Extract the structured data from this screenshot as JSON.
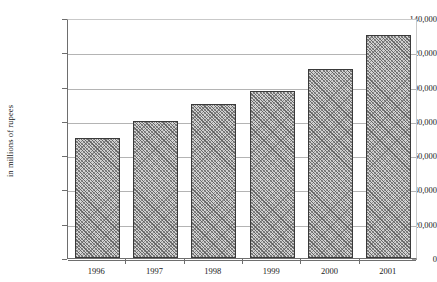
{
  "chart_data": {
    "type": "bar",
    "title": "",
    "subtitle": "",
    "xlabel": "",
    "ylabel": "in millions of rupees",
    "categories": [
      "1996",
      "1997",
      "1998",
      "1999",
      "2000",
      "2001"
    ],
    "values": [
      70000,
      80000,
      90000,
      97500,
      110500,
      130000
    ],
    "ylim": [
      0,
      140000
    ],
    "ytick_values": [
      0,
      20000,
      40000,
      60000,
      80000,
      100000,
      120000,
      140000
    ],
    "ytick_labels": [
      "0",
      "20,000",
      "40,000",
      "60,000",
      "80,000",
      "100,000",
      "120,000",
      "140,000"
    ],
    "grid": true,
    "grid_axis": "y",
    "legend": false,
    "legend_position": "none",
    "bar_fill": "#d2d2d2",
    "bar_pattern": "crosshatch",
    "bar_border_color": "#3a3a3a",
    "gridline_color": "#b4b4b4",
    "axis_color": "#6e6e6e",
    "background_color": "#ffffff",
    "text_color": "#1a1a1a"
  },
  "axis": {
    "y_title": "in millions of rupees"
  }
}
